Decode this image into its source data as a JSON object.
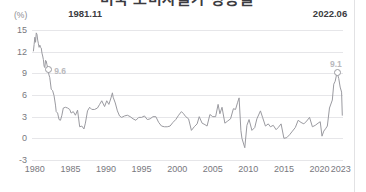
{
  "title": "미국 소비자물가 상승률",
  "axis_unit": "(%)",
  "annotations": [
    {
      "name": "peak-1981",
      "date": "1981.11",
      "value": "9.6",
      "x_year": 1981.87,
      "y_value": 9.6
    },
    {
      "name": "peak-2022",
      "date": "2022.06",
      "value": "9.1",
      "x_year": 2022.46,
      "y_value": 9.1
    }
  ],
  "chart_data": {
    "type": "line",
    "title": "미국 소비자물가 상승률",
    "xlabel": "",
    "ylabel": "(%)",
    "ylim": [
      -3,
      15
    ],
    "xlim": [
      1979.6,
      2023.3
    ],
    "grid": true,
    "legend": "none",
    "yticks": [
      15,
      12,
      9,
      6,
      3,
      0,
      -3
    ],
    "xticks": [
      1980,
      1985,
      1990,
      1995,
      2000,
      2005,
      2010,
      2015,
      2020,
      2023
    ],
    "line_color": "#9a9aa0",
    "grid_color": "#e6e6e9",
    "series": [
      {
        "name": "미국 소비자물가 상승률(전년동월비)",
        "x": [
          1979.8,
          1979.9,
          1980.0,
          1980.1,
          1980.2,
          1980.3,
          1980.4,
          1980.5,
          1980.6,
          1980.7,
          1980.8,
          1980.9,
          1981.0,
          1981.1,
          1981.2,
          1981.3,
          1981.4,
          1981.5,
          1981.6,
          1981.7,
          1981.87,
          1981.95,
          1982.1,
          1982.3,
          1982.5,
          1982.7,
          1982.9,
          1983.0,
          1983.2,
          1983.4,
          1983.6,
          1983.8,
          1984.0,
          1984.3,
          1984.6,
          1984.9,
          1985.1,
          1985.4,
          1985.7,
          1986.0,
          1986.3,
          1986.6,
          1986.9,
          1987.1,
          1987.4,
          1987.7,
          1988.0,
          1988.4,
          1988.8,
          1989.1,
          1989.4,
          1989.8,
          1990.1,
          1990.4,
          1990.7,
          1990.9,
          1991.0,
          1991.3,
          1991.6,
          1991.9,
          1992.2,
          1992.6,
          1993.0,
          1993.4,
          1993.8,
          1994.2,
          1994.6,
          1995.0,
          1995.4,
          1995.8,
          1996.2,
          1996.6,
          1997.0,
          1997.4,
          1997.8,
          1998.2,
          1998.6,
          1999.0,
          1999.4,
          1999.8,
          2000.2,
          2000.6,
          2000.9,
          2001.2,
          2001.6,
          2002.0,
          2002.4,
          2002.8,
          2003.1,
          2003.5,
          2003.9,
          2004.2,
          2004.6,
          2005.0,
          2005.4,
          2005.75,
          2006.0,
          2006.3,
          2006.7,
          2007.1,
          2007.5,
          2007.9,
          2008.2,
          2008.5,
          2008.7,
          2008.95,
          2009.1,
          2009.5,
          2009.8,
          2010.1,
          2010.5,
          2010.9,
          2011.2,
          2011.7,
          2012.0,
          2012.4,
          2012.8,
          2013.1,
          2013.5,
          2013.9,
          2014.2,
          2014.6,
          2015.0,
          2015.4,
          2015.8,
          2016.2,
          2016.6,
          2017.0,
          2017.4,
          2017.8,
          2018.2,
          2018.6,
          2019.0,
          2019.4,
          2019.8,
          2020.1,
          2020.35,
          2020.6,
          2020.9,
          2021.1,
          2021.4,
          2021.8,
          2022.0,
          2022.2,
          2022.46,
          2022.7,
          2022.9,
          2023.1,
          2023.2
        ],
        "values": [
          12.1,
          13.0,
          14.0,
          13.3,
          14.6,
          14.4,
          13.6,
          13.1,
          12.6,
          12.9,
          12.6,
          12.5,
          11.8,
          11.4,
          10.9,
          10.0,
          9.8,
          10.8,
          10.7,
          10.2,
          9.6,
          8.9,
          8.4,
          6.8,
          6.6,
          5.9,
          4.6,
          3.7,
          3.5,
          2.6,
          2.5,
          3.2,
          4.2,
          4.3,
          4.2,
          4.0,
          3.5,
          3.7,
          3.2,
          3.9,
          1.6,
          1.7,
          1.3,
          2.1,
          3.8,
          4.3,
          4.0,
          4.0,
          4.2,
          4.7,
          5.2,
          4.4,
          5.2,
          4.7,
          5.6,
          6.3,
          5.7,
          4.9,
          3.8,
          3.1,
          2.9,
          3.1,
          3.2,
          3.0,
          2.7,
          2.5,
          2.9,
          2.9,
          3.1,
          2.6,
          2.7,
          3.0,
          3.0,
          2.2,
          1.7,
          1.6,
          1.6,
          1.7,
          2.2,
          2.6,
          3.2,
          3.7,
          3.4,
          3.0,
          2.7,
          1.1,
          1.6,
          2.0,
          3.0,
          2.1,
          1.9,
          1.7,
          3.3,
          3.0,
          3.0,
          4.7,
          3.4,
          4.3,
          2.1,
          2.4,
          2.7,
          4.1,
          4.0,
          5.0,
          5.6,
          1.1,
          0.0,
          -1.3,
          1.8,
          2.6,
          1.1,
          1.5,
          2.7,
          3.8,
          2.9,
          1.7,
          2.0,
          1.6,
          1.8,
          1.2,
          1.5,
          2.0,
          0.0,
          0.1,
          0.5,
          1.0,
          1.5,
          2.5,
          2.2,
          2.0,
          2.4,
          2.9,
          1.6,
          1.8,
          2.1,
          2.3,
          0.3,
          1.0,
          1.4,
          1.7,
          4.2,
          5.3,
          7.5,
          7.9,
          9.1,
          8.3,
          7.1,
          6.4,
          3.2
        ]
      }
    ]
  }
}
